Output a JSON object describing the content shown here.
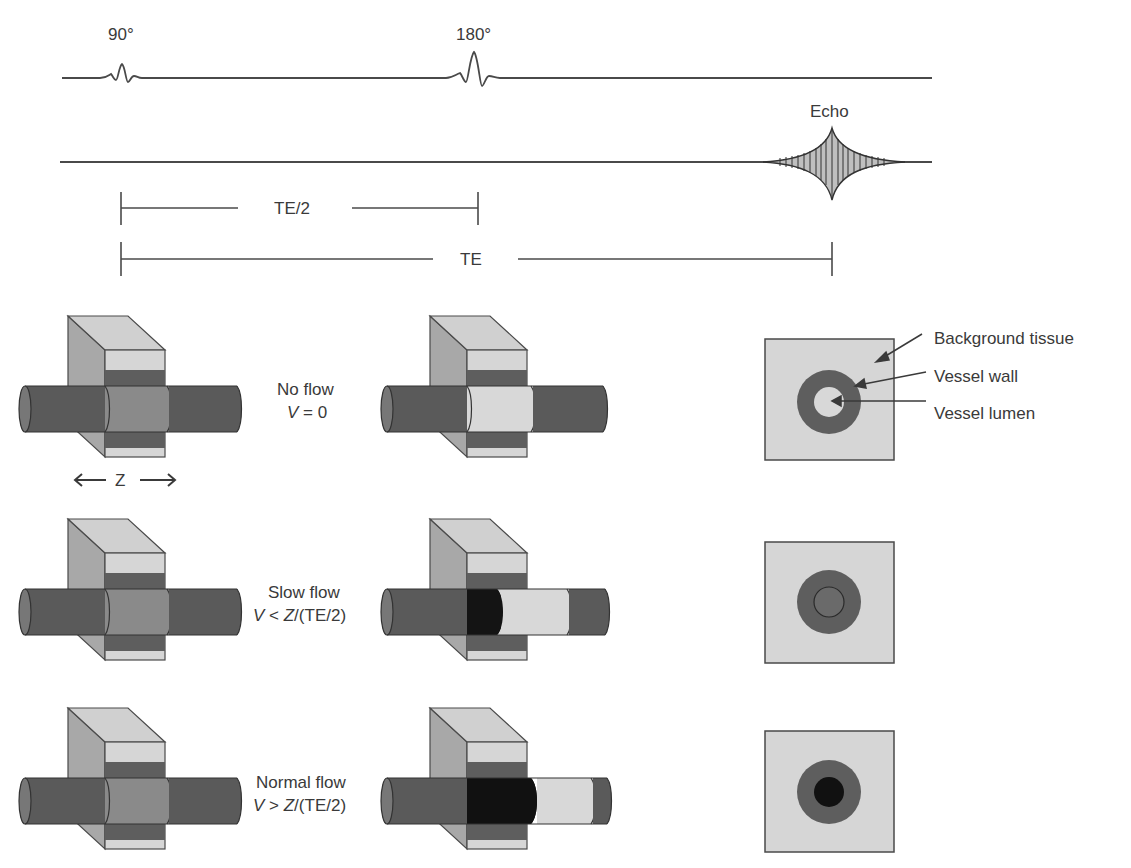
{
  "pulse_sequence": {
    "pulse_90_label": "90°",
    "pulse_180_label": "180°",
    "echo_label": "Echo",
    "te_half_label": "TE/2",
    "te_label": "TE"
  },
  "axis": {
    "z_label": "Z"
  },
  "rows": [
    {
      "condition": "No flow",
      "formula_var": "V",
      "formula_rest": " = 0",
      "lumen_state": "bright"
    },
    {
      "condition": "Slow flow",
      "formula_var": "V",
      "formula_op": " < ",
      "formula_z": "Z",
      "formula_tail": "/(TE/2)",
      "lumen_state": "partial-void"
    },
    {
      "condition": "Normal flow",
      "formula_var": "V",
      "formula_op": " > ",
      "formula_z": "Z",
      "formula_tail": "/(TE/2)",
      "lumen_state": "flow-void"
    }
  ],
  "legend": {
    "background": "Background tissue",
    "wall": "Vessel wall",
    "lumen": "Vessel lumen"
  },
  "colors": {
    "line": "#4a4a4a",
    "slab_light": "#d6d6d6",
    "slab_side": "#a8a8a8",
    "slab_top": "#cfcfcf",
    "band_dark": "#5e5e5e",
    "vessel": "#5a5a5a",
    "vessel_in_slab": "#8a8a8a",
    "lumen_bright": "#d8d8d8",
    "flow_void": "#111111"
  }
}
